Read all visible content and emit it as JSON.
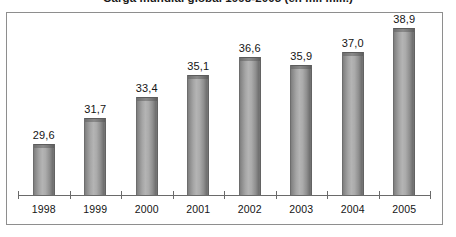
{
  "chart_data": {
    "type": "bar",
    "title": "Carga mundial global 1998-2005 (en mil mill.)",
    "subtitle": "",
    "xlabel": "",
    "ylabel": "",
    "categories": [
      "1998",
      "1999",
      "2000",
      "2001",
      "2002",
      "2003",
      "2004",
      "2005"
    ],
    "values": [
      29.6,
      31.7,
      33.4,
      35.1,
      36.6,
      35.9,
      37.0,
      38.9
    ],
    "value_labels": [
      "29,6",
      "31,7",
      "33,4",
      "35,1",
      "36,6",
      "35,9",
      "37,0",
      "38,9"
    ],
    "series": [
      {
        "name": "Carga",
        "values": [
          29.6,
          31.7,
          33.4,
          35.1,
          36.6,
          35.9,
          37.0,
          38.9
        ]
      }
    ],
    "ylim": [
      25.5,
      39.6
    ],
    "grid": false,
    "legend": "none",
    "bar_color": "#9a9a9a",
    "axis_color": "#6a6a6a",
    "frame_color": "#8e8e8e",
    "background": "#ffffff",
    "decimal_separator": ","
  }
}
